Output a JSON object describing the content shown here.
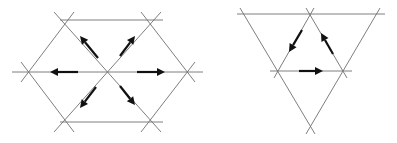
{
  "figures": [
    {
      "id": "hexagon-figure",
      "description": "Hexagonal lattice cell with six outward arrows from the center",
      "colors": {
        "lines": "#6f6f6f",
        "arrows": "#111111"
      },
      "lines": [
        [
          60,
          20,
          163,
          20
        ],
        [
          60,
          122,
          163,
          122
        ],
        [
          12,
          72,
          203,
          72
        ],
        [
          74,
          12,
          21,
          82
        ],
        [
          54,
          12,
          161,
          132
        ],
        [
          141,
          12,
          195,
          82
        ],
        [
          161,
          12,
          54,
          132
        ],
        [
          21,
          62,
          74,
          132
        ],
        [
          195,
          62,
          141,
          132
        ]
      ],
      "arrows": [
        {
          "direction": "left",
          "from": [
            78,
            72
          ],
          "to": [
            50,
            72
          ]
        },
        {
          "direction": "right",
          "from": [
            137,
            72
          ],
          "to": [
            165,
            72
          ]
        },
        {
          "direction": "up-left",
          "from": [
            98,
            58
          ],
          "to": [
            80,
            36
          ]
        },
        {
          "direction": "up-right",
          "from": [
            120,
            56
          ],
          "to": [
            135,
            36
          ]
        },
        {
          "direction": "down-left",
          "from": [
            96,
            87
          ],
          "to": [
            80,
            108
          ]
        },
        {
          "direction": "down-right",
          "from": [
            120,
            86
          ],
          "to": [
            135,
            105
          ]
        }
      ]
    },
    {
      "id": "triangle-figure",
      "description": "Inverted triangle lattice with circulating arrows around the inner triangle",
      "colors": {
        "lines": "#6f6f6f",
        "arrows": "#111111"
      },
      "lines": [
        [
          237,
          14,
          385,
          14
        ],
        [
          270,
          71,
          352,
          71
        ],
        [
          240,
          8,
          315,
          134
        ],
        [
          380,
          8,
          306,
          134
        ],
        [
          314,
          8,
          274,
          78
        ],
        [
          306,
          8,
          347,
          78
        ]
      ],
      "arrows": [
        {
          "direction": "down-left",
          "from": [
            302,
            30
          ],
          "to": [
            289,
            52
          ]
        },
        {
          "direction": "up-left",
          "from": [
            333,
            54
          ],
          "to": [
            321,
            33
          ]
        },
        {
          "direction": "right",
          "from": [
            299,
            71
          ],
          "to": [
            323,
            71
          ]
        }
      ]
    }
  ]
}
